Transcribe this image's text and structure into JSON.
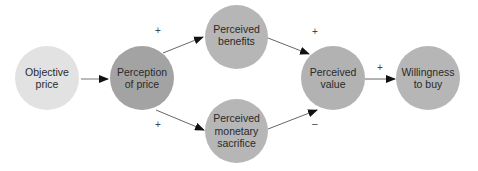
{
  "diagram": {
    "nodes": [
      {
        "id": "objective-price",
        "label_line1": "Objective",
        "label_line2": "price",
        "fill": "#e2e2e2"
      },
      {
        "id": "perception-of-price",
        "label_line1": "Perception",
        "label_line2": "of price",
        "fill": "#a3a3a3"
      },
      {
        "id": "perceived-benefits",
        "label_line1": "Perceived",
        "label_line2": "benefits",
        "fill": "#b6b6b6"
      },
      {
        "id": "perceived-monetary-sacrifice",
        "label_line1": "Perceived",
        "label_line2": "monetary",
        "label_line3": "sacrifice",
        "fill": "#b6b6b6"
      },
      {
        "id": "perceived-value",
        "label_line1": "Perceived",
        "label_line2": "value",
        "fill": "#b2b2b2"
      },
      {
        "id": "willingness-to-buy",
        "label_line1": "Willingness",
        "label_line2": "to buy",
        "fill": "#b6b6b6"
      }
    ],
    "edges": [
      {
        "from": "objective-price",
        "to": "perception-of-price",
        "sign": ""
      },
      {
        "from": "perception-of-price",
        "to": "perceived-benefits",
        "sign": "+"
      },
      {
        "from": "perception-of-price",
        "to": "perceived-monetary-sacrifice",
        "sign": "+"
      },
      {
        "from": "perceived-benefits",
        "to": "perceived-value",
        "sign": "+"
      },
      {
        "from": "perceived-monetary-sacrifice",
        "to": "perceived-value",
        "sign": "–"
      },
      {
        "from": "perceived-value",
        "to": "willingness-to-buy",
        "sign": "+"
      }
    ]
  }
}
